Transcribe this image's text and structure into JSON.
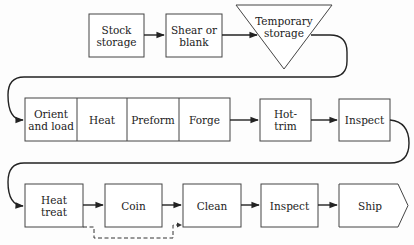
{
  "diagram": {
    "type": "process flow chart",
    "rows": [
      {
        "row": 1,
        "steps": [
          {
            "id": "stock-storage",
            "label": "Stock\nstorage",
            "shape": "rectangle"
          },
          {
            "id": "shear-or-blank",
            "label": "Shear or\nblank",
            "shape": "rectangle"
          },
          {
            "id": "temporary-storage",
            "label": "Temporary\nstorage",
            "shape": "inverted-triangle"
          }
        ]
      },
      {
        "row": 2,
        "steps": [
          {
            "id": "orient-and-load",
            "label": "Orient\nand load",
            "shape": "rectangle",
            "group": "forge-cell"
          },
          {
            "id": "heat",
            "label": "Heat",
            "shape": "rectangle",
            "group": "forge-cell"
          },
          {
            "id": "preform",
            "label": "Preform",
            "shape": "rectangle",
            "group": "forge-cell"
          },
          {
            "id": "forge",
            "label": "Forge",
            "shape": "rectangle",
            "group": "forge-cell"
          },
          {
            "id": "hot-trim",
            "label": "Hot-\ntrim",
            "shape": "rectangle"
          },
          {
            "id": "inspect-1",
            "label": "Inspect",
            "shape": "rectangle"
          }
        ]
      },
      {
        "row": 3,
        "steps": [
          {
            "id": "heat-treat",
            "label": "Heat\ntreat",
            "shape": "rectangle"
          },
          {
            "id": "coin",
            "label": "Coin",
            "shape": "rectangle"
          },
          {
            "id": "clean",
            "label": "Clean",
            "shape": "rectangle"
          },
          {
            "id": "inspect-2",
            "label": "Inspect",
            "shape": "rectangle"
          },
          {
            "id": "ship",
            "label": "Ship",
            "shape": "pentagon-arrow"
          }
        ]
      }
    ],
    "edges": [
      {
        "from": "stock-storage",
        "to": "shear-or-blank",
        "style": "solid"
      },
      {
        "from": "shear-or-blank",
        "to": "temporary-storage",
        "style": "solid"
      },
      {
        "from": "temporary-storage",
        "to": "orient-and-load",
        "style": "solid"
      },
      {
        "from": "forge",
        "to": "hot-trim",
        "style": "solid"
      },
      {
        "from": "hot-trim",
        "to": "inspect-1",
        "style": "solid"
      },
      {
        "from": "inspect-1",
        "to": "heat-treat",
        "style": "solid"
      },
      {
        "from": "heat-treat",
        "to": "coin",
        "style": "solid"
      },
      {
        "from": "coin",
        "to": "clean",
        "style": "solid"
      },
      {
        "from": "heat-treat",
        "to": "clean",
        "style": "dashed",
        "note": "optional bypass of Coin"
      },
      {
        "from": "clean",
        "to": "inspect-2",
        "style": "solid"
      },
      {
        "from": "inspect-2",
        "to": "ship",
        "style": "solid"
      }
    ]
  }
}
